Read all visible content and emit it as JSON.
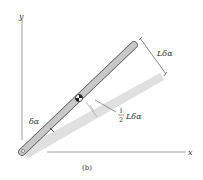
{
  "diagram": {
    "caption": "(b)",
    "axes": {
      "x_label": "x",
      "y_label": "y"
    },
    "labels": {
      "arc_end": "Lδα",
      "angle": "δα",
      "half_num": "1",
      "half_den": "2",
      "half_rest": "Lδα"
    },
    "colors": {
      "bar_fill": "#c8c8c8",
      "bar_edge": "#555555",
      "shadow_fill": "#e2e2e2",
      "axis": "#777777",
      "text": "#333333"
    }
  }
}
